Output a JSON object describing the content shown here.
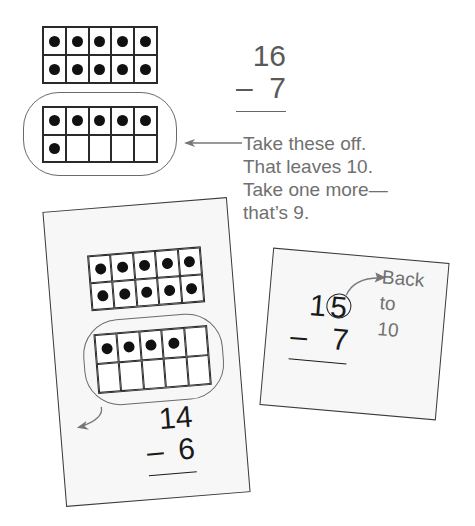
{
  "top_example": {
    "ten_frame_full": {
      "filled": 10,
      "cells": 10
    },
    "ten_frame_partial": {
      "filled": 6,
      "cells": 10
    },
    "problem": {
      "minuend": "16",
      "subtrahend": "7",
      "operator": "–"
    },
    "note_lines": [
      "Take these off.",
      "That leaves 10.",
      "Take one more—",
      "that’s 9."
    ]
  },
  "left_card": {
    "ten_frame_full": {
      "filled": 10,
      "cells": 10
    },
    "ten_frame_partial": {
      "filled": 4,
      "cells": 10
    },
    "problem": {
      "minuend": "14",
      "subtrahend": "6",
      "operator": "–"
    }
  },
  "right_card": {
    "problem": {
      "minuend_tens": "1",
      "minuend_ones_circled": "5",
      "subtrahend": "7",
      "operator": "–"
    },
    "note_lines": [
      "Back",
      "to",
      "10"
    ]
  },
  "icons": {
    "arrow_left": "arrow-left-icon",
    "curved_arrow": "curved-arrow-icon"
  },
  "colors": {
    "ink": "#1a1a1a",
    "gray_text": "#707070",
    "card_bg": "#f7f7f7"
  }
}
